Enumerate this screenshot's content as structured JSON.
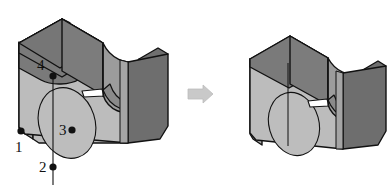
{
  "figure": {
    "title": "",
    "type": "isometric-cad-part-comparison",
    "background_color": "#ffffff",
    "line_color": "#111111"
  },
  "palette": {
    "face_front": "#b9b9b9",
    "face_front_light": "#c2c2c2",
    "face_top": "#7c7c7c",
    "face_top_dark": "#6f6f6f",
    "face_right": "#6e6e6e",
    "face_inner": "#9a9a9a",
    "face_inner_dark": "#828282",
    "face_left_edge": "#a8a8a8",
    "hole": "#bdbdbd",
    "arrow": "#c9c9c9",
    "arrow_stroke": "#b0b0b0",
    "point": "#111111"
  },
  "left_part": {
    "name": "annotated-part",
    "labels": [
      {
        "id": "1",
        "text": "1",
        "label_x": 15,
        "label_y": 152,
        "point_x": 21,
        "point_y": 131,
        "has_leader": false
      },
      {
        "id": "2",
        "text": "2",
        "label_x": 39,
        "label_y": 172,
        "point_x": 53,
        "point_y": 167,
        "has_leader": true
      },
      {
        "id": "3",
        "text": "3",
        "label_x": 59,
        "label_y": 135,
        "point_x": 72,
        "point_y": 130,
        "has_leader": false
      },
      {
        "id": "4",
        "text": "4",
        "label_x": 37,
        "label_y": 70,
        "point_x": 53,
        "point_y": 76,
        "has_leader": true
      }
    ],
    "leader_line": {
      "from_x": 53,
      "from_y": 76,
      "to_x": 53,
      "to_y": 185
    }
  },
  "arrow": {
    "name": "transform-arrow",
    "direction": "right",
    "x": 188,
    "y": 86,
    "width": 26,
    "height": 17
  },
  "right_part": {
    "name": "result-part",
    "labels": []
  }
}
